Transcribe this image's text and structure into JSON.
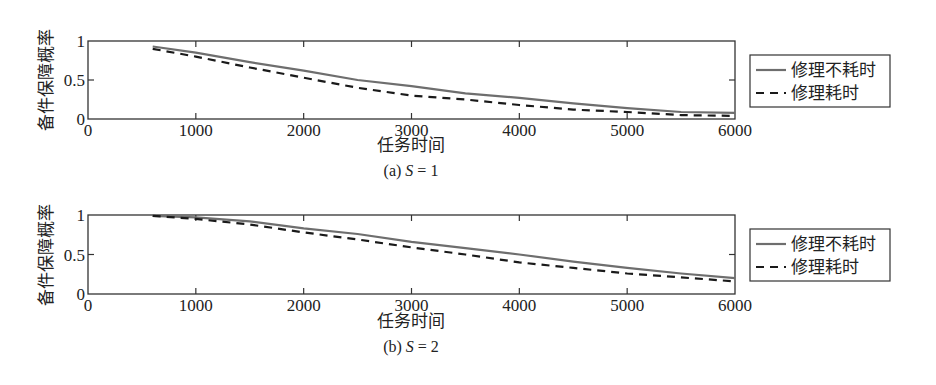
{
  "chart_data": [
    {
      "type": "line",
      "panel": "a",
      "caption": "(a) S = 1",
      "caption_prefix": "(a) ",
      "caption_var": "S",
      "caption_suffix": " = 1",
      "xlabel": "任务时间",
      "ylabel": "备件保障概率",
      "xlim": [
        0,
        6000
      ],
      "ylim": [
        0,
        1
      ],
      "xticks": [
        0,
        1000,
        2000,
        3000,
        4000,
        5000,
        6000
      ],
      "xtick_labels": [
        "0",
        "1000",
        "2000",
        "3000",
        "4000",
        "5000",
        "6000"
      ],
      "yticks": [
        0,
        0.5,
        1
      ],
      "ytick_labels": [
        "0",
        "0.5",
        "1"
      ],
      "grid": false,
      "legend_position": "right-outside",
      "x": [
        600,
        1000,
        1500,
        2000,
        2500,
        3000,
        3500,
        4000,
        4500,
        5000,
        5500,
        6000
      ],
      "series": [
        {
          "name": "修理不耗时",
          "style": "solid",
          "color": "#6e6e6e",
          "values": [
            0.93,
            0.85,
            0.73,
            0.62,
            0.5,
            0.42,
            0.33,
            0.27,
            0.2,
            0.14,
            0.09,
            0.08
          ]
        },
        {
          "name": "修理耗时",
          "style": "dashed",
          "color": "#1a1a1a",
          "values": [
            0.9,
            0.8,
            0.66,
            0.53,
            0.4,
            0.3,
            0.25,
            0.18,
            0.12,
            0.09,
            0.05,
            0.04
          ]
        }
      ]
    },
    {
      "type": "line",
      "panel": "b",
      "caption": "(b) S = 2",
      "caption_prefix": "(b) ",
      "caption_var": "S",
      "caption_suffix": " = 2",
      "xlabel": "任务时间",
      "ylabel": "备件保障概率",
      "xlim": [
        0,
        6000
      ],
      "ylim": [
        0,
        1
      ],
      "xticks": [
        0,
        1000,
        2000,
        3000,
        4000,
        5000,
        6000
      ],
      "xtick_labels": [
        "0",
        "1000",
        "2000",
        "3000",
        "4000",
        "5000",
        "6000"
      ],
      "yticks": [
        0,
        0.5,
        1
      ],
      "ytick_labels": [
        "0",
        "0.5",
        "1"
      ],
      "grid": false,
      "legend_position": "right-outside",
      "x": [
        600,
        1000,
        1500,
        2000,
        2500,
        3000,
        3500,
        4000,
        4500,
        5000,
        5500,
        6000
      ],
      "series": [
        {
          "name": "修理不耗时",
          "style": "solid",
          "color": "#6e6e6e",
          "values": [
            0.99,
            0.97,
            0.92,
            0.83,
            0.76,
            0.66,
            0.58,
            0.5,
            0.41,
            0.33,
            0.26,
            0.2
          ]
        },
        {
          "name": "修理耗时",
          "style": "dashed",
          "color": "#1a1a1a",
          "values": [
            0.99,
            0.95,
            0.88,
            0.78,
            0.69,
            0.59,
            0.5,
            0.4,
            0.33,
            0.26,
            0.21,
            0.16
          ]
        }
      ]
    }
  ]
}
